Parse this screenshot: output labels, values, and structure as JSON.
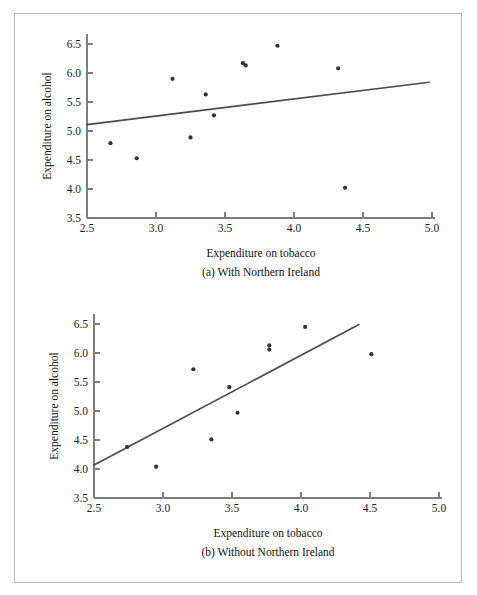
{
  "figure": {
    "border_color": "#b9b9b9",
    "background": "#ffffff"
  },
  "panel_a": {
    "caption": "(a) With Northern Ireland",
    "xlabel": "Expenditure on tobacco",
    "ylabel": "Expenditure on alcohol",
    "x_ticks": [
      "2.5",
      "3.0",
      "3.5",
      "4.0",
      "4.5",
      "5.0"
    ],
    "y_ticks": [
      "3.5",
      "4.0",
      "4.5",
      "5.0",
      "5.5",
      "6.0",
      "6.5"
    ]
  },
  "panel_b": {
    "caption": "(b) Without Northern Ireland",
    "xlabel": "Expenditure on tobacco",
    "ylabel": "Expenditure on alcohol",
    "x_ticks": [
      "2.5",
      "3.0",
      "3.5",
      "4.0",
      "4.5",
      "5.0"
    ],
    "y_ticks": [
      "3.5",
      "4.0",
      "4.5",
      "5.0",
      "5.5",
      "6.0",
      "6.5"
    ]
  },
  "chart_data": [
    {
      "type": "scatter",
      "title": "(a) With Northern Ireland",
      "xlabel": "Expenditure on tobacco",
      "ylabel": "Expenditure on alcohol",
      "xlim": [
        2.5,
        5.0
      ],
      "ylim": [
        3.5,
        6.7
      ],
      "xticks": [
        2.5,
        3.0,
        3.5,
        4.0,
        4.5,
        5.0
      ],
      "yticks": [
        3.5,
        4.0,
        4.5,
        5.0,
        5.5,
        6.0,
        6.5
      ],
      "grid": false,
      "legend": "none",
      "marker_color": "#333333",
      "line_color": "#4a4a52",
      "points": [
        {
          "x": 2.67,
          "y": 4.79
        },
        {
          "x": 2.86,
          "y": 4.53
        },
        {
          "x": 3.12,
          "y": 5.9
        },
        {
          "x": 3.25,
          "y": 4.89
        },
        {
          "x": 3.36,
          "y": 5.63
        },
        {
          "x": 3.42,
          "y": 5.27
        },
        {
          "x": 3.63,
          "y": 6.17
        },
        {
          "x": 3.65,
          "y": 6.13
        },
        {
          "x": 3.88,
          "y": 6.47
        },
        {
          "x": 4.32,
          "y": 6.08
        },
        {
          "x": 4.37,
          "y": 4.02
        }
      ],
      "fit_line": {
        "x0": 2.5,
        "y0": 5.11,
        "x1": 4.98,
        "y1": 5.84
      }
    },
    {
      "type": "scatter",
      "title": "(b) Without Northern Ireland",
      "xlabel": "Expenditure on tobacco",
      "ylabel": "Expenditure on alcohol",
      "xlim": [
        2.5,
        5.0
      ],
      "ylim": [
        3.5,
        6.7
      ],
      "xticks": [
        2.5,
        3.0,
        3.5,
        4.0,
        4.5,
        5.0
      ],
      "yticks": [
        3.5,
        4.0,
        4.5,
        5.0,
        5.5,
        6.0,
        6.5
      ],
      "grid": false,
      "legend": "none",
      "marker_color": "#333333",
      "line_color": "#4a4a52",
      "points": [
        {
          "x": 2.74,
          "y": 4.38
        },
        {
          "x": 2.95,
          "y": 4.04
        },
        {
          "x": 3.22,
          "y": 5.72
        },
        {
          "x": 3.35,
          "y": 4.51
        },
        {
          "x": 3.48,
          "y": 5.41
        },
        {
          "x": 3.54,
          "y": 4.97
        },
        {
          "x": 3.77,
          "y": 6.13
        },
        {
          "x": 3.77,
          "y": 6.06
        },
        {
          "x": 4.03,
          "y": 6.45
        },
        {
          "x": 4.51,
          "y": 5.98
        }
      ],
      "fit_line": {
        "x0": 2.5,
        "y0": 4.07,
        "x1": 4.42,
        "y1": 6.49
      }
    }
  ]
}
